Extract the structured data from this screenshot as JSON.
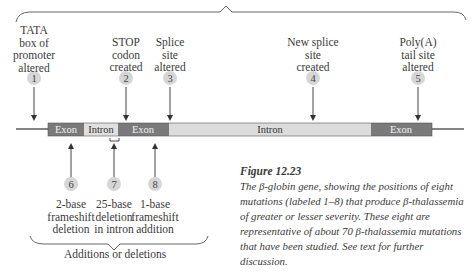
{
  "diagram": {
    "top_mutations": [
      {
        "number": "1",
        "label": "TATA\nbox of\npromoter\naltered"
      },
      {
        "number": "2",
        "label": "STOP\ncodon\ncreated"
      },
      {
        "number": "3",
        "label": "Splice\nsite\naltered"
      },
      {
        "number": "4",
        "label": "New splice\nsite\ncreated"
      },
      {
        "number": "5",
        "label": "Poly(A)\ntail site\naltered"
      }
    ],
    "bottom_mutations": [
      {
        "number": "6",
        "label": "2-base\nframeshift\ndeletion"
      },
      {
        "number": "7",
        "label": "25-base\ndeletion\nin intron"
      },
      {
        "number": "8",
        "label": "1-base\nframeshift\naddition"
      }
    ],
    "gene_segments": [
      {
        "type": "Exon",
        "label": "Exon"
      },
      {
        "type": "Intron",
        "label": "Intron"
      },
      {
        "type": "Exon",
        "label": "Exon"
      },
      {
        "type": "Intron",
        "label": "Intron"
      },
      {
        "type": "Exon",
        "label": "Exon"
      }
    ],
    "bottom_group_label": "Additions or deletions",
    "colors": {
      "exon": "#7a7a7a",
      "intron": "#dcdcdc",
      "circle": "#d6d6d6"
    }
  },
  "caption": {
    "title": "Figure 12.23",
    "text": "The β-globin gene, showing the positions of eight mutations (labeled 1–8) that produce β-thalassemia of greater or lesser severity. These eight are representative of about 70 β-thalassemia mutations that have been studied. See text for further discussion."
  }
}
